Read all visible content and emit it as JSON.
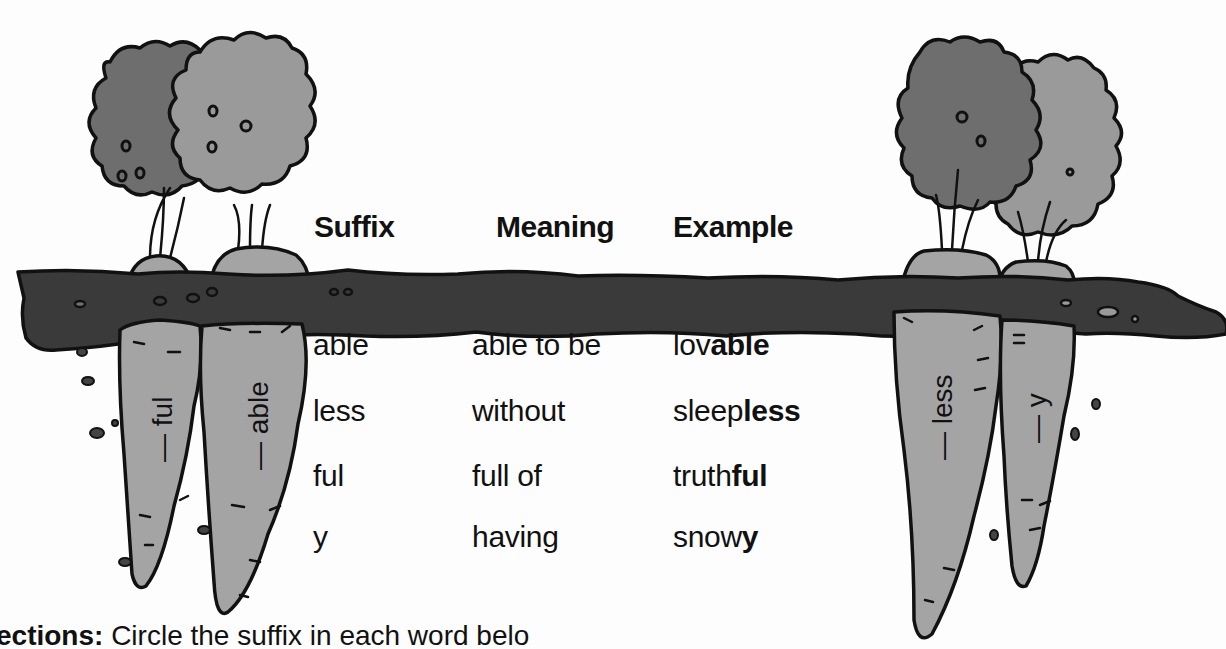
{
  "table": {
    "headers": {
      "suffix": "Suffix",
      "meaning": "Meaning",
      "example": "Example"
    },
    "rows": [
      {
        "suffix": "able",
        "meaning": "able to be",
        "example_root": "lov",
        "example_suffix": "able"
      },
      {
        "suffix": "less",
        "meaning": "without",
        "example_root": "sleep",
        "example_suffix": "less"
      },
      {
        "suffix": "ful",
        "meaning": "full of",
        "example_root": "truth",
        "example_suffix": "ful"
      },
      {
        "suffix": "y",
        "meaning": "having",
        "example_root": "snow",
        "example_suffix": "y"
      }
    ]
  },
  "carrots": {
    "left_1": "— ful",
    "left_2": "— able",
    "right_1": "— less",
    "right_2": "— y"
  },
  "directions": {
    "label": "ections:",
    "text": " Circle the suffix in each word belo"
  },
  "colors": {
    "leaf_dark": "#6e6e6e",
    "leaf_light": "#9a9a9a",
    "carrot": "#a4a4a4",
    "soil": "#3a3a3a",
    "outline": "#111111"
  }
}
